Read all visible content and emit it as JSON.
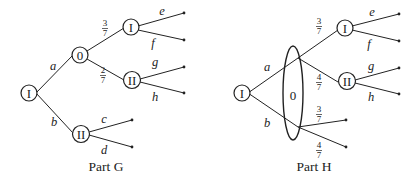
{
  "parts": [
    {
      "caption": "Part G",
      "root": "I",
      "chance_node": "0",
      "branches": {
        "a": "a",
        "b": "b"
      },
      "chance_probs": [
        "3",
        "7",
        "2",
        "7"
      ],
      "upper_player": "I",
      "lower_player": "II",
      "b_player": "II",
      "leaf_labels": {
        "e": "e",
        "f": "f",
        "g": "g",
        "h": "h",
        "c": "c",
        "d": "d"
      }
    },
    {
      "caption": "Part H",
      "root": "I",
      "chance_node": "0",
      "branches": {
        "a": "a",
        "b": "b"
      },
      "chance_probs_top": [
        "3",
        "7",
        "4",
        "7"
      ],
      "chance_probs_bottom": [
        "3",
        "7",
        "4",
        "7"
      ],
      "upper_player": "I",
      "lower_player": "II",
      "leaf_labels": {
        "e": "e",
        "f": "f",
        "g": "g",
        "h": "h"
      }
    }
  ]
}
